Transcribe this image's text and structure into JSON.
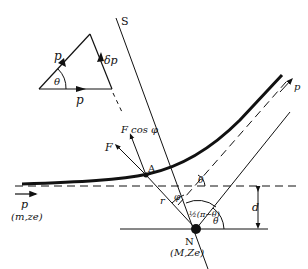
{
  "diagram": {
    "type": "Rutherford scattering geometry",
    "momentum_triangle": {
      "incoming_label": "p",
      "outgoing_label": "p",
      "change_label": "δp",
      "angle_label": "θ"
    },
    "labels": {
      "S": "S",
      "F": "F",
      "F_cos_phi": "F cos φ",
      "A": "A",
      "p_in": "p",
      "particle": "(m,ze)",
      "p_out": "p",
      "r": "r",
      "phi": "φ",
      "theta_top": "θ",
      "half_angle": "½(π−θ)",
      "theta_bottom": "θ",
      "d": "d",
      "N": "N",
      "nucleus": "(M,Ze)"
    },
    "colors": {
      "line": "#111111",
      "background": "#ffffff"
    }
  }
}
